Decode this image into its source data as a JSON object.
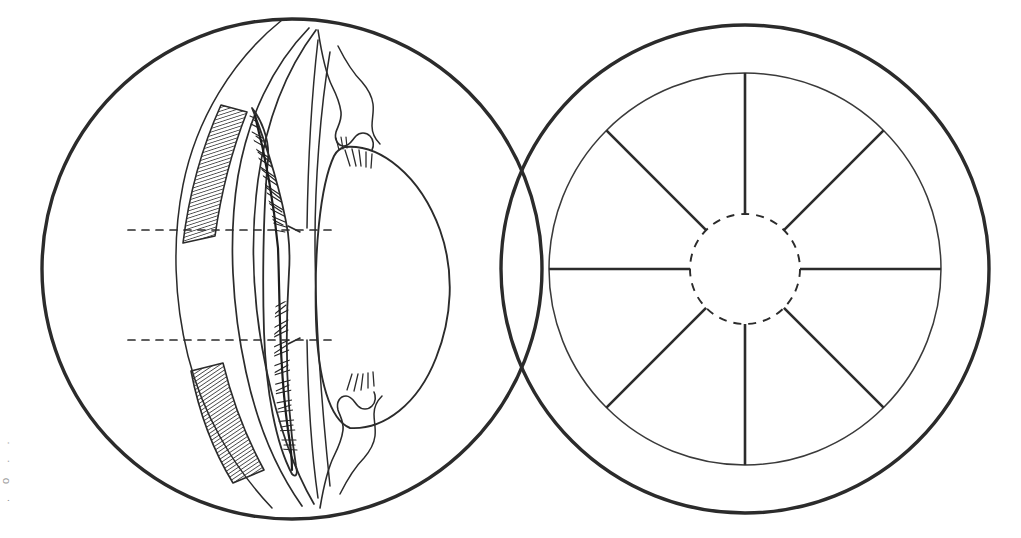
{
  "figure": {
    "background_color": "#ffffff",
    "ink_color": "#2b2b2b",
    "hatch_color": "#333333",
    "panels": [
      {
        "id": "left-panel",
        "name": "meridional-section",
        "label": "Meridional section of anterior eye",
        "center": {
          "x": 292,
          "y": 269
        },
        "radius": 250,
        "outline_width": 3.2,
        "structures": [
          {
            "name": "sclera-outline",
            "label": "Sclera / globe outline",
            "type": "circle"
          },
          {
            "name": "ciliary-muscle-band-superior",
            "label": "Ciliary muscle (hatched, superior)",
            "type": "hatched-band"
          },
          {
            "name": "ciliary-muscle-band-inferior",
            "label": "Ciliary muscle (hatched, inferior)",
            "type": "hatched-band"
          },
          {
            "name": "ciliary-processes",
            "label": "Ciliary processes (pars plicata)",
            "type": "fine-hatching"
          },
          {
            "name": "zonular-fibers",
            "label": "Zonular fibers",
            "type": "line-bundle"
          },
          {
            "name": "lens-outline",
            "label": "Lens",
            "type": "ellipse"
          },
          {
            "name": "cornea-iris-margin",
            "label": "Iris / corneal margin",
            "type": "contour"
          },
          {
            "name": "reference-line-superior",
            "label": "Superior section reference line",
            "type": "dashed-line",
            "y": 230
          },
          {
            "name": "reference-line-inferior",
            "label": "Inferior section reference line",
            "type": "dashed-line",
            "y": 340
          }
        ]
      },
      {
        "id": "right-panel",
        "name": "anterior-view",
        "label": "Anterior (en face) view of ciliary ring",
        "center": {
          "x": 745,
          "y": 269
        },
        "outer_radius": 244,
        "inner_radius": 196,
        "hub_radius": 55,
        "outline_width": 3.2,
        "spoke_count": 8,
        "spoke_angles_deg": [
          90,
          45,
          0,
          315,
          270,
          225,
          180,
          135
        ],
        "structures": [
          {
            "name": "outer-ring",
            "label": "Outer limbal ring",
            "type": "circle"
          },
          {
            "name": "inner-ring",
            "label": "Ciliary ring",
            "type": "circle"
          },
          {
            "name": "central-dashed-circle",
            "label": "Pupil / lens margin (hidden outline)",
            "type": "dashed-circle"
          },
          {
            "name": "radial-spokes",
            "label": "Radial ciliary processes",
            "type": "spokes"
          }
        ]
      }
    ],
    "margin_note": ". o . ."
  }
}
